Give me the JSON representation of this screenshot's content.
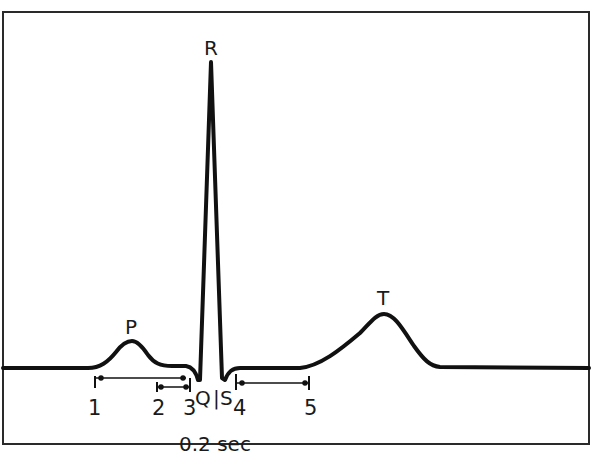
{
  "colors": {
    "trace": "#111111",
    "frame": "#2a2a2a",
    "text": "#1a1a1a",
    "background": "#ffffff"
  },
  "waves": {
    "p": "P",
    "q": "Q",
    "r": "R",
    "s": "S",
    "t": "T",
    "divider": "|"
  },
  "interval_markers": [
    "1",
    "2",
    "3",
    "4",
    "5"
  ],
  "time_scale": "0.2 sec",
  "intervals": [
    {
      "name": "PR interval",
      "from": "1",
      "to": "3"
    },
    {
      "name": "PR segment",
      "from": "2",
      "to": "3"
    },
    {
      "name": "ST segment",
      "from": "4",
      "to": "5"
    }
  ]
}
